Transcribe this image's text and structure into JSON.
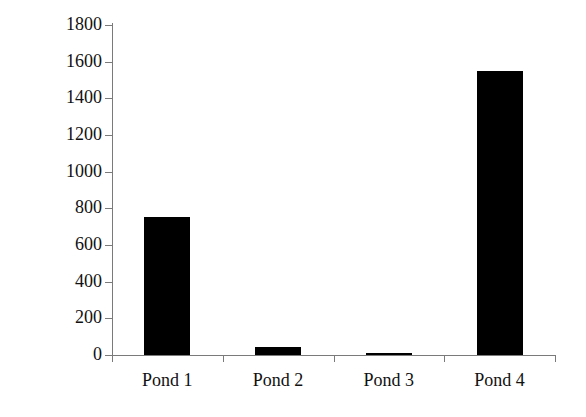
{
  "chart_data": {
    "type": "bar",
    "title": "",
    "xlabel": "",
    "ylabel": "Zooplankton biomass (µg l⁻¹)",
    "ylabel_base": "Zooplankton biomass (µg l",
    "ylabel_exponent": "-1",
    "ylabel_close": ")",
    "categories": [
      "Pond 1",
      "Pond 2",
      "Pond 3",
      "Pond 4"
    ],
    "values": [
      755,
      44,
      10,
      1550
    ],
    "ylim": [
      0,
      1800
    ],
    "ytick_step": 200,
    "yticks": [
      0,
      200,
      400,
      600,
      800,
      1000,
      1200,
      1400,
      1600,
      1800
    ],
    "ytick_labels": [
      "0",
      "200",
      "400",
      "600",
      "800",
      "1000",
      "1200",
      "1400",
      "1600",
      "1800"
    ],
    "grid": false,
    "legend": false,
    "bar_color": "#000000",
    "axis_color": "#7a7a7a",
    "background_color": "#ffffff"
  }
}
